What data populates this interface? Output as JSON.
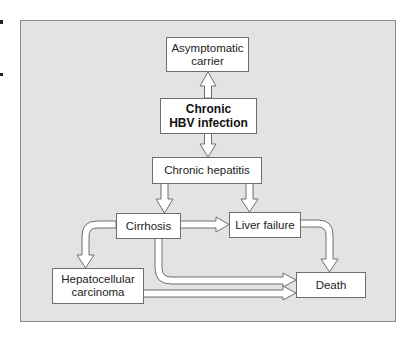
{
  "diagram": {
    "nodes": {
      "asymptomatic_carrier": {
        "line1": "Asymptomatic",
        "line2": "carrier"
      },
      "chronic_hbv": {
        "line1": "Chronic",
        "line2": "HBV infection"
      },
      "chronic_hepatitis": {
        "label": "Chronic hepatitis"
      },
      "cirrhosis": {
        "label": "Cirrhosis"
      },
      "liver_failure": {
        "label": "Liver failure"
      },
      "hcc": {
        "line1": "Hepatocellular",
        "line2": "carcinoma"
      },
      "death": {
        "label": "Death"
      }
    },
    "edges": [
      {
        "from": "Chronic HBV infection",
        "to": "Asymptomatic carrier",
        "bidirectional": true
      },
      {
        "from": "Chronic HBV infection",
        "to": "Chronic hepatitis",
        "bidirectional": true
      },
      {
        "from": "Chronic hepatitis",
        "to": "Cirrhosis"
      },
      {
        "from": "Chronic hepatitis",
        "to": "Liver failure"
      },
      {
        "from": "Cirrhosis",
        "to": "Liver failure"
      },
      {
        "from": "Cirrhosis",
        "to": "Hepatocellular carcinoma"
      },
      {
        "from": "Cirrhosis",
        "to": "Death"
      },
      {
        "from": "Liver failure",
        "to": "Death"
      },
      {
        "from": "Hepatocellular carcinoma",
        "to": "Death"
      }
    ],
    "colors": {
      "panel_bg": "#e3e3e3",
      "panel_border": "#8a8a8a",
      "node_bg": "#ffffff",
      "node_border": "#6e6e6e",
      "arrow_fill": "#ffffff",
      "arrow_stroke": "#6e6e6e"
    }
  }
}
